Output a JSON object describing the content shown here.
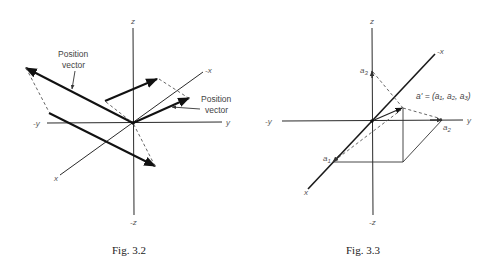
{
  "figures": [
    {
      "id": "fig-3-2",
      "caption": "Fig. 3.2",
      "axes": {
        "z": "z",
        "neg_z": "-z",
        "y": "y",
        "neg_y": "-y",
        "x": "x",
        "neg_x": "-x"
      },
      "annotations": [
        {
          "line1": "Position",
          "line2": "vector"
        },
        {
          "line1": "Position",
          "line2": "vector"
        }
      ]
    },
    {
      "id": "fig-3-3",
      "caption": "Fig. 3.3",
      "axes": {
        "z": "z",
        "neg_z": "-z",
        "y": "y",
        "neg_y": "-y",
        "x": "x",
        "neg_x": "-x"
      },
      "points": {
        "a1": "a",
        "a1_sub": "1",
        "a2": "a",
        "a2_sub": "2",
        "a3": "a",
        "a3_sub": "3"
      },
      "vector_label": "a' = (a₁, a₂, a₃)"
    }
  ],
  "colors": {
    "ink": "#111111",
    "label": "#555555",
    "background": "#ffffff"
  }
}
